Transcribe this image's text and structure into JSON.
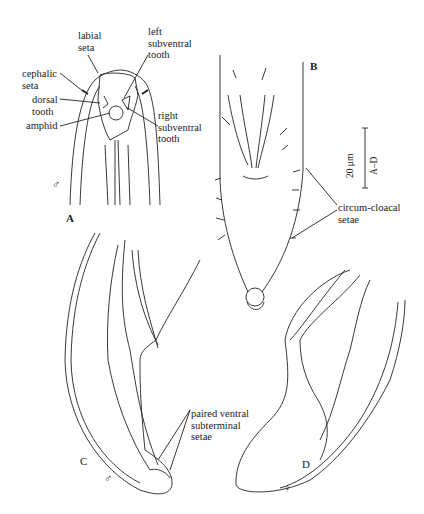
{
  "figure": {
    "panels": [
      {
        "id": "A",
        "label": "A",
        "sex_symbol": "♂",
        "annotations": [
          "labial seta",
          "cephalic seta",
          "left subventral tooth",
          "dorsal tooth",
          "amphid",
          "right subventral tooth"
        ]
      },
      {
        "id": "B",
        "label": "B",
        "annotations": [
          "circum-cloacal setae"
        ]
      },
      {
        "id": "C",
        "label": "C",
        "sex_symbol": "♂",
        "annotations": [
          "paired ventral subterminal setae"
        ]
      },
      {
        "id": "D",
        "label": "D",
        "sex_symbol": "♀"
      }
    ],
    "labels": {
      "labial_1": "labial",
      "labial_2": "seta",
      "cephalic_1": "cephalic",
      "cephalic_2": "seta",
      "left_1": "left",
      "left_2": "subventral",
      "left_3": "tooth",
      "dorsal_1": "dorsal",
      "dorsal_2": "tooth",
      "amphid": "amphid",
      "right_1": "right",
      "right_2": "subventral",
      "right_3": "tooth",
      "cloacal_1": "circum-cloacal",
      "cloacal_2": "setae",
      "paired_1": "paired ventral",
      "paired_2": "subterminal",
      "paired_3": "setae"
    },
    "scale_bar": {
      "value": "20 μm",
      "applies_to": "A–D"
    },
    "symbols": {
      "male": "♂",
      "female": "♀"
    }
  }
}
